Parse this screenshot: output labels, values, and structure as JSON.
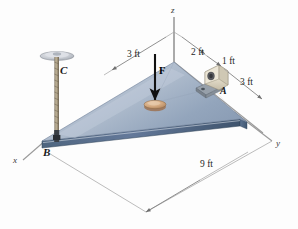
{
  "figure": {
    "type": "engineering-mechanics-free-body-diagram",
    "background_color": "#fdfdfd"
  },
  "axes": {
    "z_label": "z",
    "y_label": "y",
    "x_label": "x",
    "line_color": "#8a8a8a"
  },
  "points": {
    "A": "A",
    "B": "B",
    "C": "C"
  },
  "force": {
    "label": "F",
    "arrow_color": "#111111",
    "direction": "downward-vertical"
  },
  "dimensions": [
    {
      "label": "3 ft",
      "id": "dim-3ft-left"
    },
    {
      "label": "2 ft",
      "id": "dim-2ft"
    },
    {
      "label": "1 ft",
      "id": "dim-1ft"
    },
    {
      "label": "3 ft",
      "id": "dim-3ft-right"
    },
    {
      "label": "9 ft",
      "id": "dim-9ft"
    }
  ],
  "colors": {
    "plate_top_light": "#c2ccd9",
    "plate_top_mid": "#a6b5c8",
    "plate_top_dark": "#8d9eb4",
    "plate_edge": "#5d7490",
    "plate_edge_dark": "#40566f",
    "bracket_body": "#e8e2d2",
    "bracket_base": "#9aa3ac",
    "puck": "#d3a882",
    "cable": "#a89a84",
    "ceiling_disk": "#c8cbd0",
    "dim_line": "#7c7c7c"
  }
}
